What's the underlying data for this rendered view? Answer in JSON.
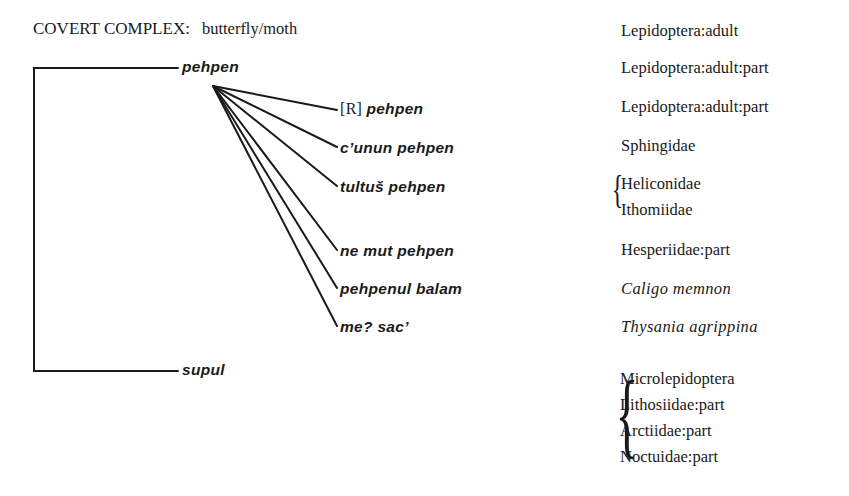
{
  "title": {
    "label": "COVERT COMPLEX:",
    "subject": "butterfly/moth"
  },
  "tree": {
    "root_gloss": "Lepidoptera:adult",
    "children": [
      {
        "term": "pehpen",
        "gloss": "Lepidoptera:adult:part",
        "children": [
          {
            "prefix": "[R]",
            "term": "pehpen",
            "gloss": [
              "Lepidoptera:adult:part"
            ],
            "gloss_italic": false
          },
          {
            "term": "c’unun pehpen",
            "gloss": [
              "Sphingidae"
            ],
            "gloss_italic": false
          },
          {
            "term": "tultuš pehpen",
            "gloss": [
              "Heliconidae",
              "Ithomiidae"
            ],
            "gloss_italic": false
          },
          {
            "term": "ne mut pehpen",
            "gloss": [
              "Hesperiidae:part"
            ],
            "gloss_italic": false
          },
          {
            "term": "pehpenul balam",
            "gloss": [
              "Caligo memnon"
            ],
            "gloss_italic": true
          },
          {
            "term": "me? sac’",
            "gloss": [
              "Thysania agrippina"
            ],
            "gloss_italic": true
          }
        ]
      },
      {
        "term": "supul",
        "gloss": [
          "Microlepidoptera",
          "Lithosiidae:part",
          "Arctiidae:part",
          "Noctuidae:part"
        ]
      }
    ]
  },
  "colors": {
    "ink": "#1a1a1a",
    "background": "#ffffff"
  }
}
